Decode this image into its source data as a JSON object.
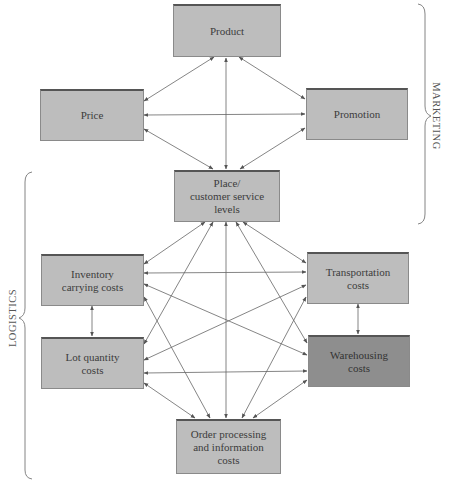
{
  "diagram": {
    "type": "relationship-network",
    "boxes": {
      "product": {
        "label": "Product",
        "shade": "light"
      },
      "price": {
        "label": "Price",
        "shade": "light"
      },
      "promotion": {
        "label": "Promotion",
        "shade": "light"
      },
      "place": {
        "label": "Place/\ncustomer service\nlevels",
        "shade": "light"
      },
      "inventory": {
        "label": "Inventory\ncarrying costs",
        "shade": "light"
      },
      "transportation": {
        "label": "Transportation\ncosts",
        "shade": "light"
      },
      "lot_quantity": {
        "label": "Lot quantity\ncosts",
        "shade": "light"
      },
      "warehousing": {
        "label": "Warehousing\ncosts",
        "shade": "dark"
      },
      "order_processing": {
        "label": "Order processing\nand information\ncosts",
        "shade": "light"
      }
    },
    "groups": {
      "marketing": {
        "label": "MARKETING",
        "members": [
          "product",
          "price",
          "promotion",
          "place"
        ]
      },
      "logistics": {
        "label": "LOGISTICS",
        "members": [
          "place",
          "inventory",
          "transportation",
          "lot_quantity",
          "warehousing",
          "order_processing"
        ]
      }
    },
    "connections": [
      [
        "product",
        "price"
      ],
      [
        "product",
        "promotion"
      ],
      [
        "product",
        "place"
      ],
      [
        "price",
        "promotion"
      ],
      [
        "price",
        "place"
      ],
      [
        "promotion",
        "place"
      ],
      [
        "place",
        "inventory"
      ],
      [
        "place",
        "transportation"
      ],
      [
        "place",
        "lot_quantity"
      ],
      [
        "place",
        "warehousing"
      ],
      [
        "place",
        "order_processing"
      ],
      [
        "inventory",
        "transportation"
      ],
      [
        "inventory",
        "lot_quantity"
      ],
      [
        "inventory",
        "warehousing"
      ],
      [
        "inventory",
        "order_processing"
      ],
      [
        "transportation",
        "lot_quantity"
      ],
      [
        "transportation",
        "warehousing"
      ],
      [
        "transportation",
        "order_processing"
      ],
      [
        "lot_quantity",
        "warehousing"
      ],
      [
        "lot_quantity",
        "order_processing"
      ],
      [
        "warehousing",
        "order_processing"
      ]
    ],
    "colors": {
      "box_fill": "#bdbdbd",
      "box_fill_dark": "#8e8e8e",
      "line": "#555555"
    }
  }
}
